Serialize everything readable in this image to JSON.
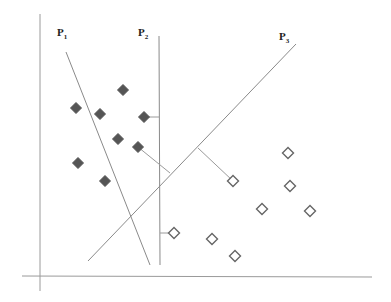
{
  "diagram": {
    "labels": [
      {
        "id": "p1",
        "text": "P",
        "sub": "1",
        "x": 57,
        "y": 26
      },
      {
        "id": "p2",
        "text": "P",
        "sub": "2",
        "x": 138,
        "y": 26
      },
      {
        "id": "p3",
        "text": "P",
        "sub": "3",
        "x": 279,
        "y": 30
      }
    ],
    "axes": {
      "x_axis": {
        "x1": 22,
        "y1": 276,
        "x2": 372,
        "y2": 277
      },
      "y_axis": {
        "x1": 40,
        "y1": 14,
        "x2": 40,
        "y2": 291
      }
    },
    "lines": [
      {
        "id": "P1",
        "x1": 66,
        "y1": 52,
        "x2": 150,
        "y2": 265
      },
      {
        "id": "P2",
        "x1": 159,
        "y1": 36,
        "x2": 160,
        "y2": 265
      },
      {
        "id": "P3",
        "x1": 296,
        "y1": 44,
        "x2": 88,
        "y2": 261
      }
    ],
    "connectors": [
      {
        "x1": 144,
        "y1": 117,
        "x2": 159,
        "y2": 117
      },
      {
        "x1": 138,
        "y1": 147,
        "x2": 170,
        "y2": 173
      },
      {
        "x1": 198,
        "y1": 148,
        "x2": 233,
        "y2": 181
      },
      {
        "x1": 160,
        "y1": 233,
        "x2": 174,
        "y2": 233
      }
    ],
    "class_filled": {
      "name": "Class A (filled diamonds)",
      "color": "#555555",
      "points": [
        [
          123,
          90
        ],
        [
          76,
          108
        ],
        [
          100,
          114
        ],
        [
          144,
          117
        ],
        [
          118,
          139
        ],
        [
          138,
          147
        ],
        [
          78,
          163
        ],
        [
          105,
          181
        ]
      ]
    },
    "class_hollow": {
      "name": "Class B (hollow diamonds)",
      "color": "#666666",
      "points": [
        [
          288,
          153
        ],
        [
          233,
          181
        ],
        [
          290,
          186
        ],
        [
          262,
          209
        ],
        [
          310,
          211
        ],
        [
          174,
          233
        ],
        [
          212,
          239
        ],
        [
          235,
          256
        ]
      ]
    }
  }
}
